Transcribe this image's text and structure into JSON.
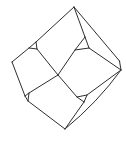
{
  "figure": {
    "background_color": "#ffffff",
    "stroke_color": "#2e2e2e",
    "stroke_width": 1,
    "vertices": {
      "T": [
        74,
        7
      ],
      "L": [
        12,
        62
      ],
      "C": [
        58,
        75
      ],
      "R": [
        121,
        70
      ],
      "B": [
        65,
        129
      ],
      "K1": [
        119.5,
        61
      ],
      "ULa": [
        36,
        42
      ],
      "ULb": [
        29,
        48
      ],
      "ULc": [
        37,
        49
      ],
      "URa": [
        85,
        37
      ],
      "URb": [
        75,
        50
      ],
      "URc": [
        89,
        48
      ],
      "LLt": [
        29,
        93
      ],
      "LLl": [
        25,
        96
      ],
      "LLb": [
        28,
        101
      ],
      "LRl": [
        77,
        97
      ],
      "LRt": [
        87,
        95
      ],
      "LRb": [
        84,
        102
      ]
    },
    "edges": [
      [
        "T",
        "ULa"
      ],
      [
        "ULa",
        "ULb"
      ],
      [
        "ULb",
        "ULc"
      ],
      [
        "ULc",
        "ULa"
      ],
      [
        "ULb",
        "L"
      ],
      [
        "L",
        "LLl"
      ],
      [
        "LLt",
        "LLl"
      ],
      [
        "LLl",
        "LLb"
      ],
      [
        "LLb",
        "LLt"
      ],
      [
        "LLb",
        "B"
      ],
      [
        "T",
        "K1"
      ],
      [
        "K1",
        "R"
      ],
      [
        "T",
        "URa"
      ],
      [
        "URa",
        "URb"
      ],
      [
        "URb",
        "URc"
      ],
      [
        "URc",
        "URa"
      ],
      [
        "URc",
        "R"
      ],
      [
        "URb",
        "C"
      ],
      [
        "ULc",
        "C"
      ],
      [
        "C",
        "LLt"
      ],
      [
        "C",
        "LRl"
      ],
      [
        "LRl",
        "LRt"
      ],
      [
        "LRt",
        "LRb"
      ],
      [
        "LRb",
        "LRl"
      ],
      [
        "LRt",
        "R"
      ],
      [
        "LRb",
        "B"
      ]
    ],
    "curves": [
      {
        "from": "B",
        "to": "R",
        "control": [
          97,
          103
        ]
      }
    ]
  }
}
